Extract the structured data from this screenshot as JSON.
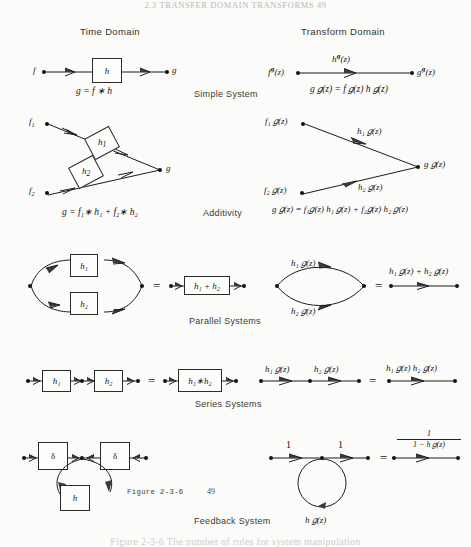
{
  "page": {
    "running_head": "2.3   TRANSFER DOMAIN TRANSFORMS   49",
    "figure_number": "Figure 2-3-6",
    "page_number": "49",
    "caption": "Figure 2-3-6  The number of rules for system manipulation"
  },
  "columns": {
    "left": "Time Domain",
    "right": "Transform Domain"
  },
  "row_labels": {
    "simple": "Simple System",
    "additivity": "Additivity",
    "parallel": "Parallel Systems",
    "series": "Series Systems",
    "feedback": "Feedback System"
  },
  "simple_system": {
    "time": {
      "input": "f",
      "block": "h",
      "output": "g",
      "equation": "g = f ∗ h"
    },
    "transform": {
      "input": "f",
      "input_sup": "g",
      "input_arg": "(z)",
      "edge_label": "h",
      "edge_sup": "g",
      "edge_arg": "(z)",
      "output": "g",
      "output_sup": "g",
      "output_arg": "(z)",
      "equation_parts": [
        "g",
        "(z) = f",
        "(z) h",
        "(z)"
      ],
      "equation_plain": "g 𝑔(z) = f 𝑔(z) h 𝑔(z)"
    }
  },
  "additivity": {
    "time": {
      "input1": "f",
      "input1_sub": "1",
      "input2": "f",
      "input2_sub": "2",
      "block1": "h",
      "block1_sub": "1",
      "block2": "h",
      "block2_sub": "2",
      "output": "g",
      "equation": "g = f₁∗ h₁ + f₂∗ h₂"
    },
    "transform": {
      "input1": "f₁ 𝑔(z)",
      "input2": "f₂ 𝑔(z)",
      "edge1": "h₁ 𝑔(z)",
      "edge2": "h₂ 𝑔(z)",
      "output": "g 𝑔(z)",
      "equation": "g 𝑔(z) = f₁𝑔(z) h₁ 𝑔(z) + f₂𝑔(z) h₂ 𝑔(z)"
    }
  },
  "parallel": {
    "time": {
      "block1": "h₁",
      "block2": "h₂",
      "result_block": "h₁ + h₂",
      "equals": "="
    },
    "transform": {
      "edge1": "h₁ 𝑔(z)",
      "edge2": "h₂ 𝑔(z)",
      "result": "h₁ 𝑔(z) + h₂ 𝑔(z)",
      "equals": "="
    }
  },
  "series": {
    "time": {
      "block1": "h₁",
      "block2": "h₂",
      "result_block": "h₁∗h₂",
      "equals": "="
    },
    "transform": {
      "edge1": "h₁ 𝑔(z)",
      "edge2": "h₂ 𝑔(z)",
      "result": "h₁ 𝑔(z) h₂ 𝑔(z)",
      "equals": "="
    }
  },
  "feedback": {
    "time": {
      "block1": "δ",
      "block2": "δ",
      "loop_block": "h"
    },
    "transform": {
      "edge1": "1",
      "edge2": "1",
      "loop_label": "h 𝑔(z)",
      "equals": "=",
      "result_numerator": "1",
      "result_denominator": "1 − h 𝑔(z)"
    }
  }
}
